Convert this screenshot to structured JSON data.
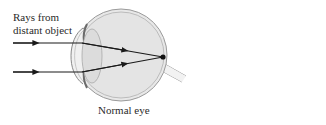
{
  "diagram": {
    "title": "Normal eye",
    "labels": {
      "rays_line1": "Rays from",
      "rays_line2": "distant object",
      "caption": "Normal eye"
    },
    "elements": [
      {
        "name": "incoming-ray-upper",
        "type": "arrow-ray"
      },
      {
        "name": "incoming-ray-lower",
        "type": "arrow-ray"
      },
      {
        "name": "eyeball",
        "type": "circle"
      },
      {
        "name": "cornea",
        "type": "curve"
      },
      {
        "name": "lens",
        "type": "ellipse"
      },
      {
        "name": "focal-point",
        "type": "dot",
        "location": "retina"
      },
      {
        "name": "optic-nerve",
        "type": "tube"
      }
    ],
    "colors": {
      "ray": "#1a1a1a",
      "eye_outline": "#9a9a9a",
      "eye_fill": "#e6e6e6",
      "lens_fill": "#dcdcdc",
      "iris": "#7a7a7a",
      "text": "#2a2a2a"
    }
  }
}
